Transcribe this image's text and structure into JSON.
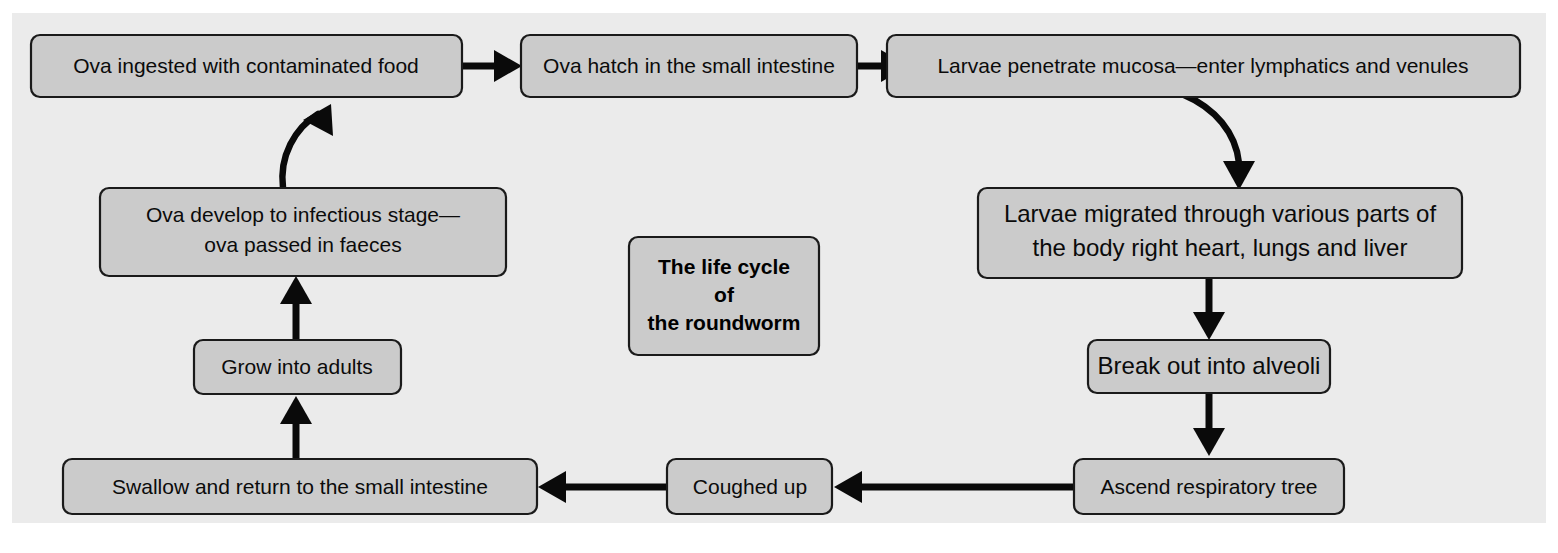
{
  "figure": {
    "title": "The life cycle of the roundworm",
    "panel_color": "#ebebeb",
    "box_fill_color": "#cbcbcb",
    "box_border_color": "#1a1a1a",
    "arrow_color": "#0a0a0a",
    "page_background": "#ffffff"
  },
  "center_label": {
    "line1": "The life cycle",
    "line2": "of",
    "line3": "the roundworm"
  },
  "nodes": {
    "ova_ingested": {
      "label": "Ova ingested with contaminated food"
    },
    "ova_hatch": {
      "label": "Ova hatch in the small intestine"
    },
    "larvae_penetrate": {
      "label": "Larvae penetrate mucosa—enter lymphatics and venules"
    },
    "larvae_migrated": {
      "line1": "Larvae migrated through various parts of",
      "line2": "the body right heart, lungs and liver"
    },
    "break_out": {
      "label": "Break out into alveoli"
    },
    "ascend": {
      "label": "Ascend respiratory tree"
    },
    "coughed_up": {
      "label": "Coughed up"
    },
    "swallow_return": {
      "label": "Swallow and return to the small intestine"
    },
    "grow_adults": {
      "label": "Grow into adults"
    },
    "ova_develop": {
      "line1": "Ova develop to infectious stage—",
      "line2": "ova passed in faeces"
    }
  },
  "connectors": [
    {
      "name": "ova-ingested-to-ova-hatch",
      "direction": "right",
      "style": "straight"
    },
    {
      "name": "ova-hatch-to-larvae-penetrate",
      "direction": "right",
      "style": "straight"
    },
    {
      "name": "larvae-penetrate-to-larvae-migrated",
      "direction": "down",
      "style": "curved"
    },
    {
      "name": "larvae-migrated-to-break-out",
      "direction": "down",
      "style": "straight"
    },
    {
      "name": "break-out-to-ascend",
      "direction": "down",
      "style": "straight"
    },
    {
      "name": "ascend-to-coughed-up",
      "direction": "left",
      "style": "straight"
    },
    {
      "name": "coughed-up-to-swallow-return",
      "direction": "left",
      "style": "straight"
    },
    {
      "name": "swallow-return-to-grow-adults",
      "direction": "up",
      "style": "straight"
    },
    {
      "name": "grow-adults-to-ova-develop",
      "direction": "up",
      "style": "straight"
    },
    {
      "name": "ova-develop-to-ova-ingested",
      "direction": "up-right",
      "style": "curved"
    }
  ]
}
